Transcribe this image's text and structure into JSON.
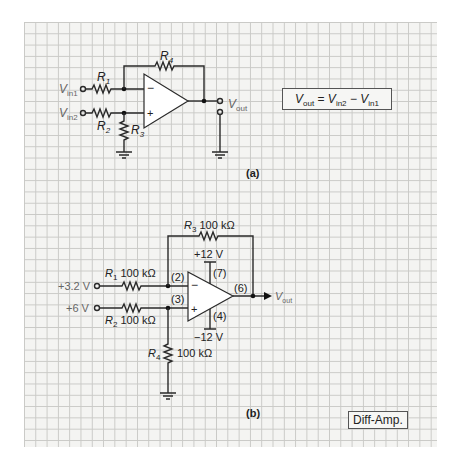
{
  "figure_a": {
    "label": "(a)",
    "inputs": [
      {
        "name": "V",
        "sub": "in1"
      },
      {
        "name": "V",
        "sub": "in2"
      }
    ],
    "resistors": [
      "R1",
      "R2",
      "R3",
      "R4"
    ],
    "output": {
      "name": "V",
      "sub": "out"
    },
    "opamp_pins": {
      "inverting": "−",
      "noninverting": "+"
    },
    "equation": {
      "lhs": "V",
      "lhs_sub": "out",
      "eq": " = ",
      "a": "V",
      "a_sub": "in2",
      "op": " − ",
      "b": "V",
      "b_sub": "in1"
    }
  },
  "figure_b": {
    "label": "(b)",
    "inputs": [
      "+3.2 V",
      "+6 V"
    ],
    "R1": "100 kΩ",
    "R2": "100 kΩ",
    "R3": "100 kΩ",
    "R4": "100 kΩ",
    "supply_pos": "+12 V",
    "supply_neg": "−12 V",
    "pins": {
      "inv": "(2)",
      "noninv": "(3)",
      "pos": "(7)",
      "neg": "(4)",
      "out": "(6)"
    },
    "output": {
      "name": "V",
      "sub": "out"
    }
  },
  "tag": "Diff-Amp."
}
